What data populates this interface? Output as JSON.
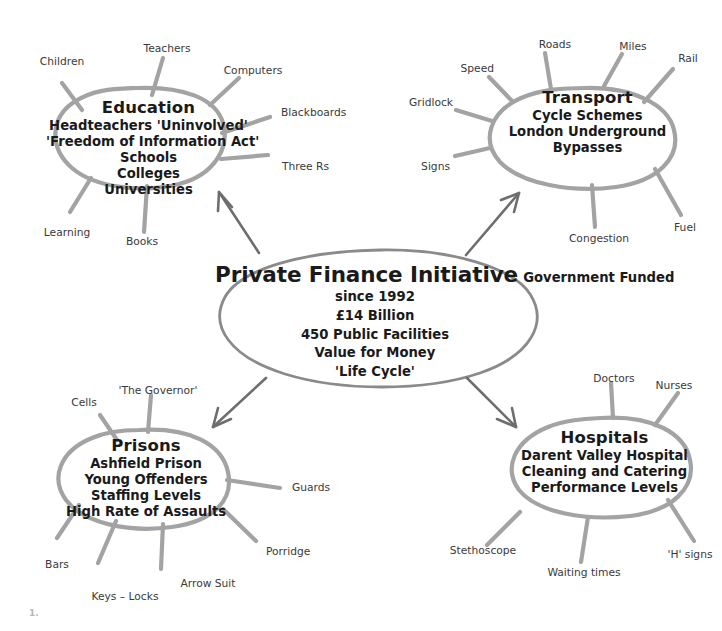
{
  "diagram": {
    "type": "mind-map",
    "corner_mark": "1.",
    "center": {
      "title": "Private Finance Initiative",
      "lines": [
        "Government Funded",
        "since 1992",
        "£14 Billion",
        "450 Public Facilities",
        "Value for Money",
        "'Life Cycle'"
      ]
    },
    "topics": [
      {
        "id": "education",
        "title": "Education",
        "lines": [
          "Headteachers 'Uninvolved'",
          "'Freedom of Information Act'",
          "Schools",
          "Colleges",
          "Universities"
        ],
        "branches": [
          "Children",
          "Teachers",
          "Computers",
          "Blackboards",
          "Three Rs",
          "Books",
          "Learning"
        ]
      },
      {
        "id": "transport",
        "title": "Transport",
        "lines": [
          "Cycle Schemes",
          "London Underground",
          "Bypasses"
        ],
        "branches": [
          "Roads",
          "Miles",
          "Rail",
          "Speed",
          "Gridlock",
          "Signs",
          "Congestion",
          "Fuel"
        ]
      },
      {
        "id": "prisons",
        "title": "Prisons",
        "lines": [
          "Ashfield Prison",
          "Young Offenders",
          "Staffing Levels",
          "High Rate of Assaults"
        ],
        "branches": [
          "'The Governor'",
          "Cells",
          "Guards",
          "Porridge",
          "Arrow Suit",
          "Keys – Locks",
          "Bars"
        ]
      },
      {
        "id": "hospitals",
        "title": "Hospitals",
        "lines": [
          "Darent Valley Hospital",
          "Cleaning and Catering",
          "Performance Levels"
        ],
        "branches": [
          "Doctors",
          "Nurses",
          "'H' signs",
          "Waiting times",
          "Stethoscope"
        ]
      }
    ],
    "colors": {
      "background": "#ffffff",
      "topic_stroke": "#a3a3a3",
      "center_stroke": "#8a8a8a",
      "arrow_stroke": "#6e6e6e",
      "text": "#1a1a1a",
      "branch_label_text": "#3a3a3a"
    }
  }
}
